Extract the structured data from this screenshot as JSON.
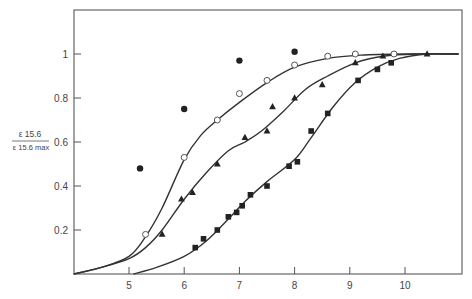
{
  "chart_data": {
    "type": "scatter",
    "title": "",
    "xlabel": "",
    "ylabel_numerator": "ε 15.6",
    "ylabel_denominator": "ε 15.6 max",
    "xlim": [
      4,
      11
    ],
    "ylim": [
      0,
      1.2
    ],
    "x_ticks": [
      "5",
      "6",
      "7",
      "8",
      "9",
      "10"
    ],
    "y_ticks": [
      "0.2",
      "0.4",
      "0.6",
      "0.8",
      "1"
    ],
    "grid": false,
    "series": [
      {
        "name": "filled circles",
        "marker": "filled-circle",
        "points": [
          [
            5.2,
            0.48
          ],
          [
            6.0,
            0.75
          ],
          [
            7.0,
            0.97
          ],
          [
            8.0,
            1.01
          ]
        ]
      },
      {
        "name": "open circles",
        "marker": "open-circle",
        "fit_curve": true,
        "points": [
          [
            5.3,
            0.18
          ],
          [
            6.0,
            0.53
          ],
          [
            6.6,
            0.7
          ],
          [
            7.0,
            0.82
          ],
          [
            7.5,
            0.88
          ],
          [
            8.0,
            0.95
          ],
          [
            8.6,
            0.99
          ],
          [
            9.1,
            1.0
          ],
          [
            9.8,
            1.0
          ]
        ]
      },
      {
        "name": "filled triangles",
        "marker": "filled-triangle",
        "fit_curve": true,
        "points": [
          [
            5.6,
            0.18
          ],
          [
            5.95,
            0.34
          ],
          [
            6.15,
            0.37
          ],
          [
            6.6,
            0.5
          ],
          [
            7.1,
            0.62
          ],
          [
            7.5,
            0.65
          ],
          [
            7.6,
            0.76
          ],
          [
            8.0,
            0.8
          ],
          [
            8.5,
            0.86
          ],
          [
            9.1,
            0.96
          ],
          [
            9.6,
            0.99
          ],
          [
            10.4,
            1.0
          ]
        ]
      },
      {
        "name": "filled squares",
        "marker": "filled-square",
        "fit_curve": true,
        "points": [
          [
            6.2,
            0.12
          ],
          [
            6.35,
            0.16
          ],
          [
            6.6,
            0.2
          ],
          [
            6.8,
            0.26
          ],
          [
            6.95,
            0.28
          ],
          [
            7.05,
            0.31
          ],
          [
            7.2,
            0.36
          ],
          [
            7.5,
            0.4
          ],
          [
            7.9,
            0.49
          ],
          [
            8.05,
            0.51
          ],
          [
            8.3,
            0.65
          ],
          [
            8.6,
            0.73
          ],
          [
            9.15,
            0.88
          ],
          [
            9.5,
            0.93
          ],
          [
            9.75,
            0.96
          ]
        ]
      }
    ]
  }
}
